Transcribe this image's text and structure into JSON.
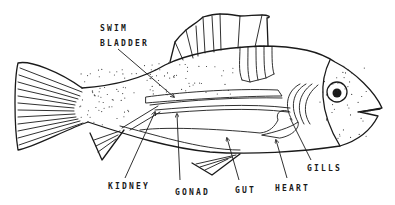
{
  "diagram": {
    "labels": {
      "swim_bladder_line1": "SWIM",
      "swim_bladder_line2": "BLADDER",
      "kidney": "KIDNEY",
      "gonad": "GONAD",
      "gut": "GUT",
      "heart": "HEART",
      "gills": "GILLS"
    },
    "colors": {
      "ink": "#1a1a1a",
      "background": "#ffffff"
    }
  }
}
